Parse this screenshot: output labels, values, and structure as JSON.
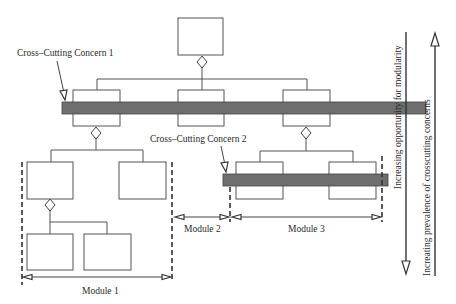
{
  "diagram": {
    "type": "module-hierarchy-with-crosscutting-concerns",
    "colors": {
      "background": "#ffffff",
      "concern_bar": "#6e6e6e",
      "line": "#555555",
      "text": "#2a2a2a"
    },
    "labels": {
      "concern_1": "Cross–Cutting Concern 1",
      "concern_2": "Cross–Cutting Concern  2",
      "module_1": "Module 1",
      "module_2": "Module 2",
      "module_3": "Module 3",
      "axis_modularity": "Increasing opportunity for modularity",
      "axis_crosscutting": "Increating prevalence of crosscutting concerns"
    },
    "nodes": [
      {
        "id": "root",
        "level": 0
      },
      {
        "id": "l1-left",
        "level": 1,
        "parent": "root"
      },
      {
        "id": "l1-middle",
        "level": 1,
        "parent": "root"
      },
      {
        "id": "l1-right",
        "level": 1,
        "parent": "root"
      },
      {
        "id": "l2-left-a",
        "level": 2,
        "parent": "l1-left",
        "module": "Module 1"
      },
      {
        "id": "l2-left-b",
        "level": 2,
        "parent": "l1-left",
        "module": "Module 1"
      },
      {
        "id": "l3-left-a",
        "level": 3,
        "parent": "l2-left-a",
        "module": "Module 1"
      },
      {
        "id": "l3-left-b",
        "level": 3,
        "parent": "l2-left-a",
        "module": "Module 1"
      },
      {
        "id": "l2-right-a",
        "level": 2,
        "parent": "l1-right",
        "module": "Module 3"
      },
      {
        "id": "l2-right-b",
        "level": 2,
        "parent": "l1-right",
        "module": "Module 3"
      }
    ],
    "concerns": [
      {
        "name": "Cross-Cutting Concern 1",
        "spans": [
          "l1-left",
          "l1-middle",
          "l1-right"
        ]
      },
      {
        "name": "Cross-Cutting Concern 2",
        "spans": [
          "l2-right-a",
          "l2-right-b"
        ]
      }
    ],
    "axes": [
      {
        "label": "Increasing opportunity for modularity",
        "direction": "down"
      },
      {
        "label": "Increating prevalence of crosscutting concerns",
        "direction": "up"
      }
    ]
  }
}
